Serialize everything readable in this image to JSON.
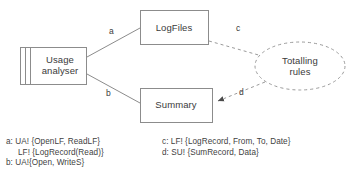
{
  "diagram": {
    "nodes": [
      {
        "id": "usage-analyser",
        "label": "Usage\nanalyser",
        "shape": "task-box"
      },
      {
        "id": "logfiles",
        "label": "LogFiles",
        "shape": "box"
      },
      {
        "id": "summary",
        "label": "Summary",
        "shape": "box"
      },
      {
        "id": "totalling-rules",
        "label": "Totalling\nrules",
        "shape": "dashed-ellipse"
      }
    ],
    "edges": [
      {
        "id": "edge-a",
        "label": "a",
        "from": "usage-analyser",
        "to": "logfiles",
        "style": "solid",
        "arrow": "none"
      },
      {
        "id": "edge-b",
        "label": "b",
        "from": "usage-analyser",
        "to": "summary",
        "style": "solid",
        "arrow": "none"
      },
      {
        "id": "edge-c",
        "label": "c",
        "from": "logfiles",
        "to": "totalling-rules",
        "style": "dashed",
        "arrow": "none"
      },
      {
        "id": "edge-d",
        "label": "d",
        "from": "totalling-rules",
        "to": "summary",
        "style": "dashed",
        "arrow": "filled"
      }
    ],
    "colors": {
      "stroke": "#8c8c8c",
      "text": "#3a3a3a",
      "background": "#ffffff"
    }
  },
  "legend": {
    "left": [
      {
        "key": "a",
        "text": "a: UA! {OpenLF, ReadLF}",
        "indent": false
      },
      {
        "key": "a2",
        "text": "LF! {LogRecord(Read)}",
        "indent": true
      },
      {
        "key": "b",
        "text": "b: UA!{Open, WriteS}",
        "indent": false
      }
    ],
    "right": [
      {
        "key": "c",
        "text": "c: LF! {LogRecord, From, To, Date}",
        "indent": false
      },
      {
        "key": "d",
        "text": "d: SU! {SumRecord, Data}",
        "indent": false
      }
    ]
  }
}
